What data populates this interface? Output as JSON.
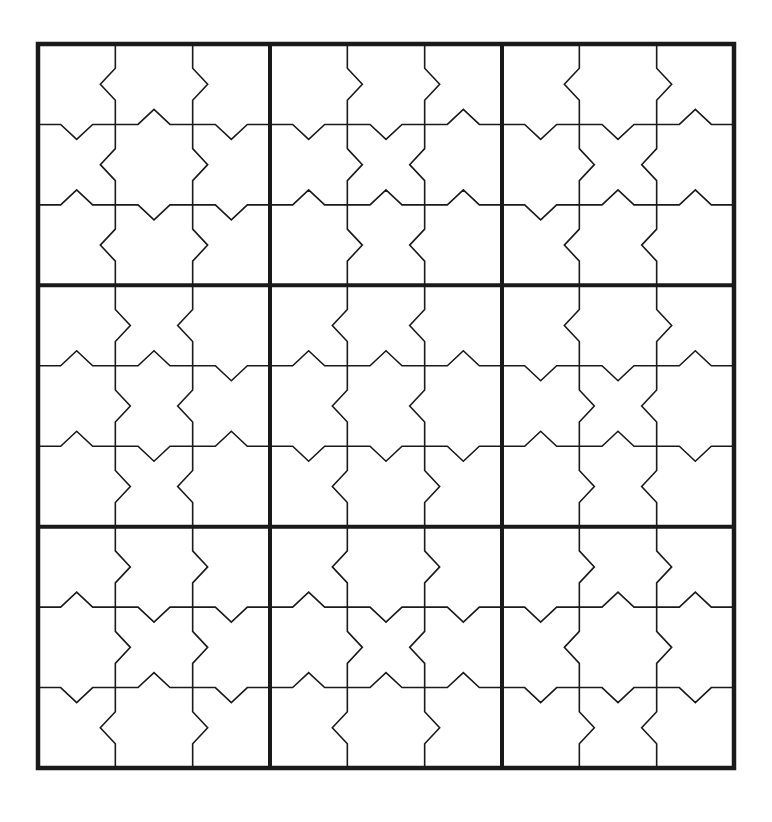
{
  "puzzle": {
    "type": "jigsaw-notched sudoku grid",
    "size": 9,
    "box_size": 3,
    "colors": {
      "line": "#1a1a1a",
      "background": "#ffffff"
    },
    "bounds": {
      "left": 38,
      "top": 44,
      "right": 734,
      "bottom": 768
    },
    "notch": {
      "depth": 15,
      "half_width": 16
    },
    "boxes": [
      {
        "row": 0,
        "col": 0,
        "v1": [
          "L",
          "L",
          "L"
        ],
        "v2": [
          "R",
          "R",
          "R"
        ],
        "h1": [
          "D",
          "U",
          "D"
        ],
        "h2": [
          "U",
          "D",
          "D"
        ]
      },
      {
        "row": 0,
        "col": 1,
        "v1": [
          "R",
          "R",
          "R"
        ],
        "v2": [
          "R",
          "L",
          "L"
        ],
        "h1": [
          "D",
          "D",
          "U"
        ],
        "h2": [
          "U",
          "U",
          "U"
        ]
      },
      {
        "row": 0,
        "col": 2,
        "v1": [
          "L",
          "R",
          "L"
        ],
        "v2": [
          "R",
          "L",
          "L"
        ],
        "h1": [
          "D",
          "D",
          "U"
        ],
        "h2": [
          "D",
          "U",
          "U"
        ]
      },
      {
        "row": 1,
        "col": 0,
        "v1": [
          "R",
          "R",
          "R"
        ],
        "v2": [
          "L",
          "L",
          "L"
        ],
        "h1": [
          "U",
          "U",
          "D"
        ],
        "h2": [
          "U",
          "D",
          "U"
        ]
      },
      {
        "row": 1,
        "col": 1,
        "v1": [
          "L",
          "L",
          "L"
        ],
        "v2": [
          "L",
          "L",
          "R"
        ],
        "h1": [
          "U",
          "U",
          "U"
        ],
        "h2": [
          "D",
          "D",
          "D"
        ]
      },
      {
        "row": 1,
        "col": 2,
        "v1": [
          "L",
          "R",
          "R"
        ],
        "v2": [
          "R",
          "L",
          "L"
        ],
        "h1": [
          "D",
          "D",
          "U"
        ],
        "h2": [
          "U",
          "U",
          "D"
        ]
      },
      {
        "row": 2,
        "col": 0,
        "v1": [
          "R",
          "R",
          "L"
        ],
        "v2": [
          "R",
          "R",
          "R"
        ],
        "h1": [
          "U",
          "D",
          "D"
        ],
        "h2": [
          "D",
          "U",
          "D"
        ]
      },
      {
        "row": 2,
        "col": 1,
        "v1": [
          "L",
          "R",
          "L"
        ],
        "v2": [
          "R",
          "L",
          "R"
        ],
        "h1": [
          "U",
          "D",
          "D"
        ],
        "h2": [
          "U",
          "U",
          "U"
        ]
      },
      {
        "row": 2,
        "col": 2,
        "v1": [
          "R",
          "L",
          "R"
        ],
        "v2": [
          "R",
          "R",
          "L"
        ],
        "h1": [
          "D",
          "U",
          "U"
        ],
        "h2": [
          "D",
          "D",
          "D"
        ]
      }
    ],
    "cells": []
  }
}
